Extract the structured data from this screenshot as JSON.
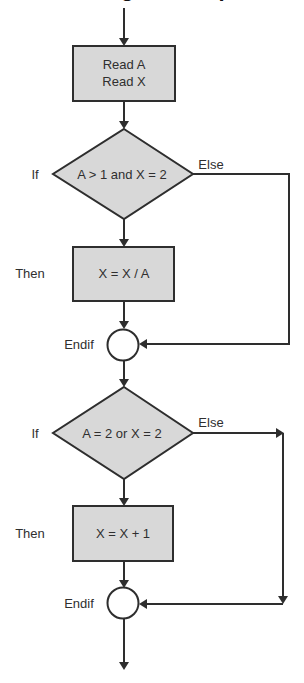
{
  "diagram": {
    "title_clipped": "Nesting If Example",
    "colors": {
      "shape_fill": "#d8d8d8",
      "stroke": "#2e2e2e",
      "text": "#2f2f2f",
      "background": "#ffffff"
    },
    "process_1": {
      "line1": "Read A",
      "line2": "Read X"
    },
    "decision_1": {
      "condition": "A > 1 and X = 2",
      "if_label": "If",
      "else_label": "Else"
    },
    "process_2": {
      "then_label": "Then",
      "text": "X = X / A"
    },
    "junction_1": {
      "label": "Endif"
    },
    "decision_2": {
      "condition": "A = 2 or X = 2",
      "if_label": "If",
      "else_label": "Else"
    },
    "process_3": {
      "then_label": "Then",
      "text": "X = X + 1"
    },
    "junction_2": {
      "label": "Endif"
    }
  }
}
